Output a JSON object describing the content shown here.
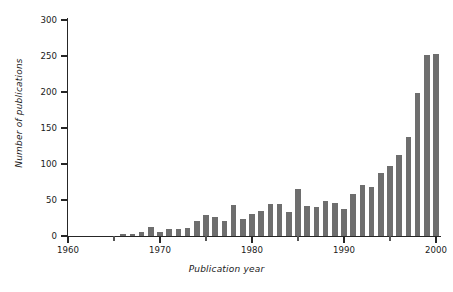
{
  "chart_data": {
    "type": "bar",
    "title": "",
    "subtitle": "",
    "xlabel": "Publication year",
    "ylabel": "Number of publications",
    "xlim": [
      1960,
      2000
    ],
    "ylim": [
      0,
      300
    ],
    "grid": false,
    "legend": null,
    "bar_color": "#6e6e6e",
    "axis_color": "#262626",
    "xticks": [
      1960,
      1970,
      1980,
      1990,
      2000
    ],
    "xticklabels": [
      "1960",
      "1970",
      "1980",
      "1990",
      "2000"
    ],
    "yticks": [
      0,
      50,
      100,
      150,
      200,
      250,
      300
    ],
    "yticklabels": [
      "0",
      "50",
      "100",
      "150",
      "200",
      "250",
      "300"
    ],
    "categories": [
      1966,
      1967,
      1968,
      1969,
      1970,
      1971,
      1972,
      1973,
      1974,
      1975,
      1976,
      1977,
      1978,
      1979,
      1980,
      1981,
      1982,
      1983,
      1984,
      1985,
      1986,
      1987,
      1988,
      1989,
      1990,
      1991,
      1992,
      1993,
      1994,
      1995,
      1996,
      1997,
      1998,
      1999,
      2000
    ],
    "values": [
      3,
      3,
      6,
      12,
      6,
      10,
      10,
      11,
      21,
      29,
      27,
      21,
      43,
      24,
      31,
      35,
      44,
      45,
      33,
      65,
      42,
      40,
      49,
      46,
      37,
      58,
      71,
      68,
      87,
      97,
      112,
      137,
      198,
      252,
      253
    ]
  },
  "axis_titles": {
    "x": "Publication year",
    "y": "Number of publications"
  }
}
